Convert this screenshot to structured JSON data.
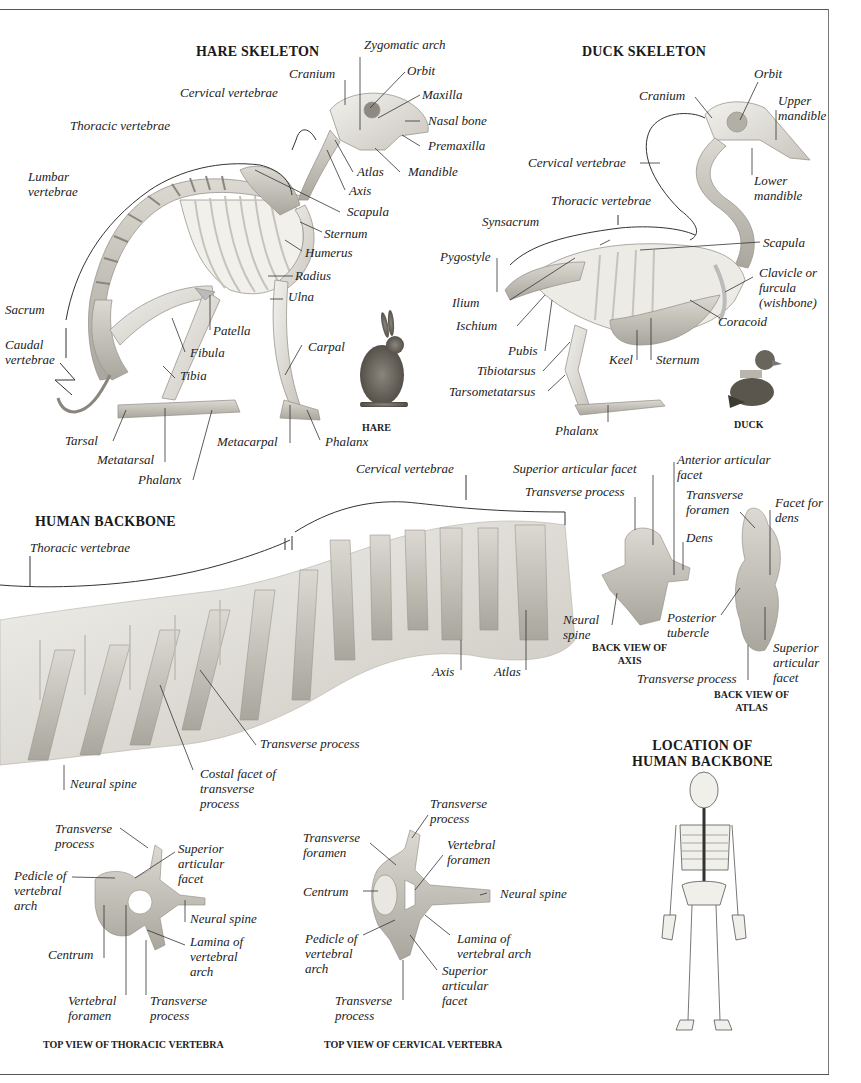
{
  "hare": {
    "title": "HARE SKELETON",
    "caption": "HARE",
    "labels": {
      "zygomatic_arch": "Zygomatic arch",
      "cranium": "Cranium",
      "orbit": "Orbit",
      "cervical_vertebrae": "Cervical vertebrae",
      "maxilla": "Maxilla",
      "nasal_bone": "Nasal bone",
      "thoracic_vertebrae": "Thoracic vertebrae",
      "premaxilla": "Premaxilla",
      "atlas": "Atlas",
      "mandible": "Mandible",
      "lumbar_vertebrae": "Lumbar\nvertebrae",
      "axis": "Axis",
      "scapula": "Scapula",
      "sternum": "Sternum",
      "humerus": "Humerus",
      "radius": "Radius",
      "ulna": "Ulna",
      "sacrum": "Sacrum",
      "patella": "Patella",
      "caudal_vertebrae": "Caudal\nvertebrae",
      "fibula": "Fibula",
      "carpal": "Carpal",
      "tibia": "Tibia",
      "tarsal": "Tarsal",
      "metacarpal": "Metacarpal",
      "phalanx_fore": "Phalanx",
      "metatarsal": "Metatarsal",
      "phalanx_hind": "Phalanx"
    }
  },
  "duck": {
    "title": "DUCK SKELETON",
    "caption": "DUCK",
    "labels": {
      "orbit": "Orbit",
      "cranium": "Cranium",
      "upper_mandible": "Upper\nmandible",
      "cervical_vertebrae": "Cervical vertebrae",
      "lower_mandible": "Lower\nmandible",
      "thoracic_vertebrae": "Thoracic vertebrae",
      "synsacrum": "Synsacrum",
      "scapula": "Scapula",
      "pygostyle": "Pygostyle",
      "clavicle": "Clavicle or\nfurcula\n(wishbone)",
      "ilium": "Ilium",
      "ischium": "Ischium",
      "coracoid": "Coracoid",
      "pubis": "Pubis",
      "keel": "Keel",
      "sternum": "Sternum",
      "tibiotarsus": "Tibiotarsus",
      "tarsometatarsus": "Tarsometatarsus",
      "phalanx": "Phalanx"
    }
  },
  "backbone": {
    "title": "HUMAN BACKBONE",
    "labels": {
      "cervical_vertebrae": "Cervical vertebrae",
      "thoracic_vertebrae": "Thoracic vertebrae",
      "axis": "Axis",
      "atlas": "Atlas",
      "transverse_process": "Transverse process",
      "neural_spine": "Neural spine",
      "costal_facet": "Costal facet of\ntransverse\nprocess"
    }
  },
  "axis_view": {
    "caption": "BACK VIEW OF\nAXIS",
    "labels": {
      "superior_articular_facet": "Superior articular facet",
      "anterior_articular_facet": "Anterior articular\nfacet",
      "transverse_process": "Transverse process",
      "dens": "Dens",
      "neural_spine": "Neural\nspine"
    }
  },
  "atlas_view": {
    "caption": "BACK VIEW OF\nATLAS",
    "labels": {
      "transverse_foramen": "Transverse\nforamen",
      "facet_for_dens": "Facet for\ndens",
      "posterior_tubercle": "Posterior\ntubercle",
      "superior_articular_facet": "Superior\narticular\nfacet",
      "transverse_process": "Transverse process"
    }
  },
  "location": {
    "title": "LOCATION OF\nHUMAN BACKBONE"
  },
  "thoracic_top": {
    "caption": "TOP VIEW OF THORACIC VERTEBRA",
    "labels": {
      "transverse_process_top": "Transverse\nprocess",
      "superior_articular_facet": "Superior\narticular\nfacet",
      "pedicle": "Pedicle of\nvertebral\narch",
      "neural_spine": "Neural spine",
      "lamina": "Lamina of\nvertebral\narch",
      "centrum": "Centrum",
      "vertebral_foramen": "Vertebral\nforamen",
      "transverse_process_bottom": "Transverse\nprocess"
    }
  },
  "cervical_top": {
    "caption": "TOP VIEW OF CERVICAL VERTEBRA",
    "labels": {
      "transverse_process_top": "Transverse\nprocess",
      "transverse_foramen": "Transverse\nforamen",
      "vertebral_foramen": "Vertebral\nforamen",
      "centrum": "Centrum",
      "neural_spine": "Neural spine",
      "pedicle": "Pedicle of\nvertebral\narch",
      "lamina": "Lamina of\nvertebral arch",
      "superior_articular_facet": "Superior\narticular\nfacet",
      "transverse_process_bottom": "Transverse\nprocess"
    }
  },
  "colors": {
    "bone": "#e8e6e0",
    "bone_shadow": "#bdbab2",
    "leader": "#333333",
    "frame": "#555555"
  }
}
